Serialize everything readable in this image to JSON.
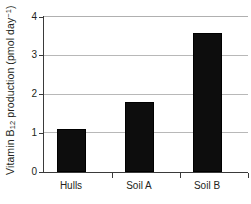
{
  "chart_data": {
    "type": "bar",
    "title": "",
    "subtitle": "",
    "categories": [
      "Hulls",
      "Soil A",
      "Soil B"
    ],
    "values": [
      1.1,
      1.8,
      3.6
    ],
    "xlabel": "",
    "ylabel_plain": "Vitamin B12 production (pmol day-1)",
    "ylabel_parts": {
      "prefix": "Vitamin B",
      "subscript": "12",
      "middle": " production (pmol day",
      "superscript": "−1",
      "suffix": ")"
    },
    "ylim": [
      0,
      4
    ],
    "yticks": [
      0,
      1,
      2,
      3,
      4
    ],
    "ytick_labels": [
      "0",
      "1",
      "2",
      "3",
      "4"
    ],
    "grid": true,
    "grid_axis": "y",
    "legend": false,
    "legend_position": "none",
    "bar_color": "#0d0d0d",
    "grid_color": "#b8b8b8",
    "axis_color": "#3a3a3a",
    "text_color": "#231f20",
    "background_color": "#ffffff"
  }
}
